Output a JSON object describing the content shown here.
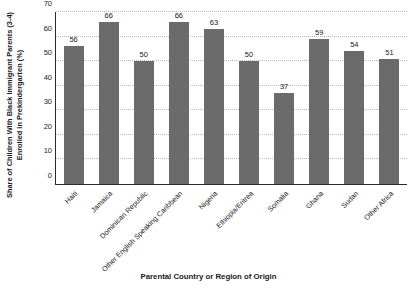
{
  "chart_data": {
    "type": "bar",
    "title": "",
    "xlabel": "Parental Country or Region of Origin",
    "ylabel_line1": "Share of Children With Black Immigrant Parents (3-4)",
    "ylabel_line2": "Enrolled in Prekindergarten (%)",
    "categories": [
      "Haiti",
      "Jamaica",
      "Dominican Republic",
      "Other English Speaking Caribbean",
      "Nigeria",
      "Ethiopia/Eritrea",
      "Somalia",
      "Ghana",
      "Sudan",
      "Other Africa"
    ],
    "values": [
      56,
      66,
      50,
      66,
      63,
      50,
      37,
      59,
      54,
      51
    ],
    "ylim": [
      0,
      70
    ],
    "yticks": [
      0,
      10,
      20,
      30,
      40,
      50,
      60,
      70
    ],
    "grid": true,
    "legend": false,
    "bar_color": "#6b6b6b",
    "gridline_color": "#b9b9b9",
    "axis_color": "#2b2b2b",
    "background": "#ffffff"
  }
}
